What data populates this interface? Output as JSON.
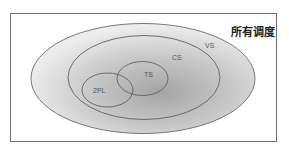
{
  "diagram": {
    "title": "所有调度",
    "sets": [
      {
        "id": "vs",
        "label": "VS"
      },
      {
        "id": "cs",
        "label": "CS"
      },
      {
        "id": "ts",
        "label": "TS"
      },
      {
        "id": "2pl",
        "label": "2PL"
      }
    ],
    "colors": {
      "frame": "#6e6e6e",
      "outline": "#6a6a6a",
      "fill_light": "#f0f0f0",
      "fill_dark": "#a9a9a9"
    }
  }
}
